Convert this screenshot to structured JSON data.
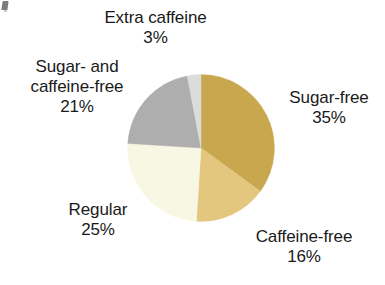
{
  "artifact": {
    "name": "scan-artifact",
    "description": "faint ink speck at top-left edge of scanned figure"
  },
  "chart_data": {
    "type": "pie",
    "title": "",
    "subtitle": "",
    "xlabel": "",
    "ylabel": "",
    "legend_position": "none",
    "labels_position": "outside",
    "grid": false,
    "start_angle_deg": 0,
    "direction": "clockwise",
    "units": "%",
    "categories": [
      "Sugar-free",
      "Caffeine-free",
      "Regular",
      "Sugar- and caffeine-free",
      "Extra caffeine"
    ],
    "values": [
      35,
      16,
      25,
      21,
      3
    ],
    "colors": [
      "#c9a74e",
      "#e3c77e",
      "#f7f7e4",
      "#aeaeae",
      "#dcdcdc"
    ],
    "slices": [
      {
        "label": "Sugar-free",
        "value": 35,
        "value_text": "35%",
        "color": "#c9a74e",
        "start_deg": 0,
        "end_deg": 126
      },
      {
        "label": "Caffeine-free",
        "value": 16,
        "value_text": "16%",
        "color": "#e3c77e",
        "start_deg": 126,
        "end_deg": 183.6
      },
      {
        "label": "Regular",
        "value": 25,
        "value_text": "25%",
        "color": "#f7f7e4",
        "start_deg": 183.6,
        "end_deg": 273.6
      },
      {
        "label": "Sugar- and caffeine-free",
        "value": 21,
        "value_text": "21%",
        "color": "#aeaeae",
        "start_deg": 273.6,
        "end_deg": 349.2
      },
      {
        "label": "Extra caffeine",
        "value": 3,
        "value_text": "3%",
        "color": "#dcdcdc",
        "start_deg": 349.2,
        "end_deg": 360
      }
    ]
  },
  "labels": {
    "extra_caffeine": {
      "name": "Extra caffeine",
      "pct": "3%"
    },
    "sugar_and_caffeine_free": {
      "line1": "Sugar- and",
      "line2": "caffeine-free",
      "pct": "21%"
    },
    "sugar_free": {
      "name": "Sugar-free",
      "pct": "35%"
    },
    "regular": {
      "name": "Regular",
      "pct": "25%"
    },
    "caffeine_free": {
      "name": "Caffeine-free",
      "pct": "16%"
    }
  }
}
